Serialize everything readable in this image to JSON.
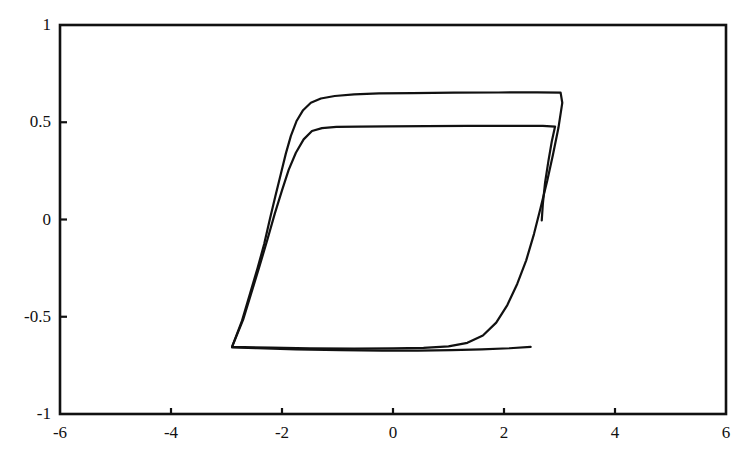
{
  "chart_data": {
    "type": "line",
    "title": "",
    "subtitle": "",
    "xlabel": "",
    "ylabel": "",
    "xlim": [
      -6,
      6
    ],
    "ylim": [
      -1,
      1
    ],
    "xticks": [
      -6,
      -4,
      -2,
      0,
      2,
      4,
      6
    ],
    "yticks": [
      -1,
      -0.5,
      0,
      0.5,
      1
    ],
    "xtick_labels": [
      "-6",
      "-4",
      "-2",
      "0",
      "2",
      "4",
      "6"
    ],
    "ytick_labels": [
      "-1",
      "-0.5",
      "0",
      "0.5",
      "1"
    ],
    "grid": false,
    "legend": null,
    "legend_position": "none",
    "frame": "box",
    "line_color": "#111111",
    "line_width": 2.2,
    "series": [
      {
        "name": "outer-hysteresis-loop",
        "points": [
          [
            -2.9,
            -0.655
          ],
          [
            -2.72,
            -0.52
          ],
          [
            -2.58,
            -0.385
          ],
          [
            -2.44,
            -0.25
          ],
          [
            -2.32,
            -0.125
          ],
          [
            -2.22,
            0.0
          ],
          [
            -2.12,
            0.12
          ],
          [
            -2.02,
            0.235
          ],
          [
            -1.93,
            0.34
          ],
          [
            -1.84,
            0.43
          ],
          [
            -1.74,
            0.505
          ],
          [
            -1.62,
            0.562
          ],
          [
            -1.48,
            0.6
          ],
          [
            -1.3,
            0.622
          ],
          [
            -1.05,
            0.635
          ],
          [
            -0.7,
            0.643
          ],
          [
            -0.25,
            0.648
          ],
          [
            0.35,
            0.65
          ],
          [
            1.1,
            0.652
          ],
          [
            1.9,
            0.653
          ],
          [
            2.6,
            0.654
          ],
          [
            3.02,
            0.652
          ],
          [
            3.05,
            0.6
          ],
          [
            2.98,
            0.47
          ],
          [
            2.88,
            0.33
          ],
          [
            2.78,
            0.2
          ],
          [
            2.66,
            0.06
          ],
          [
            2.54,
            -0.075
          ],
          [
            2.4,
            -0.21
          ],
          [
            2.24,
            -0.33
          ],
          [
            2.06,
            -0.44
          ],
          [
            1.86,
            -0.53
          ],
          [
            1.62,
            -0.596
          ],
          [
            1.34,
            -0.634
          ],
          [
            1.0,
            -0.652
          ],
          [
            0.55,
            -0.66
          ],
          [
            0.0,
            -0.663
          ],
          [
            -0.7,
            -0.664
          ],
          [
            -1.5,
            -0.662
          ],
          [
            -2.2,
            -0.659
          ],
          [
            -2.9,
            -0.655
          ]
        ]
      },
      {
        "name": "inner-hysteresis-loop",
        "points": [
          [
            -2.9,
            -0.655
          ],
          [
            -2.7,
            -0.515
          ],
          [
            -2.55,
            -0.375
          ],
          [
            -2.4,
            -0.235
          ],
          [
            -2.26,
            -0.1
          ],
          [
            -2.13,
            0.03
          ],
          [
            -2.0,
            0.15
          ],
          [
            -1.88,
            0.255
          ],
          [
            -1.75,
            0.343
          ],
          [
            -1.61,
            0.412
          ],
          [
            -1.46,
            0.455
          ],
          [
            -1.28,
            0.47
          ],
          [
            -1.02,
            0.476
          ],
          [
            -0.62,
            0.478
          ],
          [
            -0.1,
            0.479
          ],
          [
            0.6,
            0.48
          ],
          [
            1.35,
            0.481
          ],
          [
            2.1,
            0.481
          ],
          [
            2.7,
            0.481
          ],
          [
            2.92,
            0.478
          ],
          [
            2.86,
            0.4
          ],
          [
            2.8,
            0.3
          ],
          [
            2.74,
            0.19
          ],
          [
            2.7,
            0.08
          ],
          [
            2.68,
            -0.005
          ]
        ]
      },
      {
        "name": "lower-return-trace",
        "points": [
          [
            2.48,
            -0.655
          ],
          [
            2.1,
            -0.662
          ],
          [
            1.6,
            -0.668
          ],
          [
            1.05,
            -0.672
          ],
          [
            0.45,
            -0.674
          ],
          [
            -0.2,
            -0.674
          ],
          [
            -0.95,
            -0.672
          ],
          [
            -1.75,
            -0.668
          ],
          [
            -2.45,
            -0.662
          ],
          [
            -2.9,
            -0.658
          ]
        ]
      }
    ]
  }
}
